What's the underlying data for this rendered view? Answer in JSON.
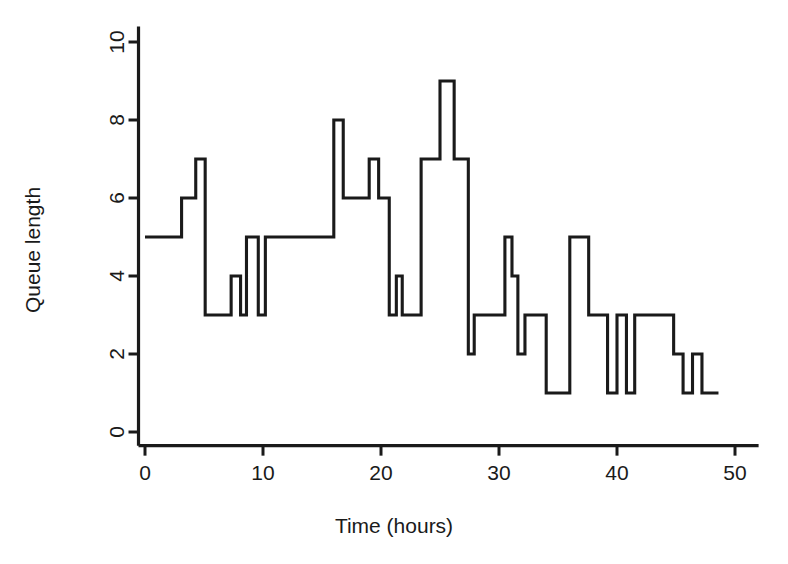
{
  "figure": {
    "background": "#ffffff",
    "ink_color": "#1a1a1a",
    "width": 788,
    "height": 564
  },
  "chart_data": {
    "type": "line",
    "line_style": "step-post",
    "title": "",
    "subtitle": "",
    "xlabel": "Time (hours)",
    "ylabel": "Queue length",
    "xlim": [
      -1.2,
      52.0
    ],
    "ylim": [
      -0.35,
      10.4
    ],
    "xticks": [
      0,
      10,
      20,
      30,
      40,
      50
    ],
    "xtick_labels": [
      "0",
      "10",
      "20",
      "30",
      "40",
      "50"
    ],
    "yticks": [
      0,
      2,
      4,
      6,
      8,
      10
    ],
    "ytick_labels": [
      "0",
      "2",
      "4",
      "6",
      "8",
      "10"
    ],
    "grid": false,
    "legend": null,
    "series": [
      {
        "name": "Queue length",
        "color": "#1a1a1a",
        "x": [
          0.0,
          3.1,
          4.3,
          5.1,
          6.5,
          7.3,
          8.1,
          8.6,
          9.1,
          9.6,
          10.2,
          16.0,
          16.8,
          18.2,
          19.0,
          19.8,
          20.7,
          21.3,
          21.8,
          22.7,
          23.4,
          24.0,
          25.0,
          26.2,
          27.4,
          27.9,
          28.5,
          30.5,
          31.1,
          31.6,
          32.2,
          33.0,
          34.0,
          35.0,
          36.0,
          37.6,
          38.4,
          39.2,
          40.0,
          40.8,
          41.5,
          42.2,
          44.8,
          45.6,
          46.4,
          47.2,
          48.0,
          48.6
        ],
        "y": [
          5,
          6,
          7,
          3,
          3,
          4,
          3,
          5,
          5,
          3,
          5,
          8,
          6,
          6,
          7,
          6,
          3,
          4,
          3,
          3,
          7,
          7,
          9,
          7,
          2,
          3,
          3,
          5,
          4,
          2,
          3,
          3,
          1,
          1,
          5,
          5,
          3,
          1,
          3,
          1,
          3,
          3,
          2,
          1,
          2,
          1,
          1,
          1
        ],
        "steps": [
          {
            "x0": 0.0,
            "x1": 3.1,
            "y": 5
          },
          {
            "x0": 3.1,
            "x1": 4.3,
            "y": 6
          },
          {
            "x0": 4.3,
            "x1": 5.1,
            "y": 7
          },
          {
            "x0": 5.1,
            "x1": 7.3,
            "y": 3
          },
          {
            "x0": 7.3,
            "x1": 8.1,
            "y": 4
          },
          {
            "x0": 8.1,
            "x1": 8.6,
            "y": 3
          },
          {
            "x0": 8.6,
            "x1": 9.6,
            "y": 5
          },
          {
            "x0": 9.6,
            "x1": 10.2,
            "y": 3
          },
          {
            "x0": 10.2,
            "x1": 16.0,
            "y": 5
          },
          {
            "x0": 16.0,
            "x1": 16.8,
            "y": 8
          },
          {
            "x0": 16.8,
            "x1": 19.0,
            "y": 6
          },
          {
            "x0": 19.0,
            "x1": 19.8,
            "y": 7
          },
          {
            "x0": 19.8,
            "x1": 20.7,
            "y": 6
          },
          {
            "x0": 20.7,
            "x1": 21.3,
            "y": 3
          },
          {
            "x0": 21.3,
            "x1": 21.8,
            "y": 4
          },
          {
            "x0": 21.8,
            "x1": 23.4,
            "y": 3
          },
          {
            "x0": 23.4,
            "x1": 25.0,
            "y": 7
          },
          {
            "x0": 25.0,
            "x1": 26.2,
            "y": 9
          },
          {
            "x0": 26.2,
            "x1": 27.4,
            "y": 7
          },
          {
            "x0": 27.4,
            "x1": 27.9,
            "y": 2
          },
          {
            "x0": 27.9,
            "x1": 30.5,
            "y": 3
          },
          {
            "x0": 30.5,
            "x1": 31.1,
            "y": 5
          },
          {
            "x0": 31.1,
            "x1": 31.6,
            "y": 4
          },
          {
            "x0": 31.6,
            "x1": 32.2,
            "y": 2
          },
          {
            "x0": 32.2,
            "x1": 34.0,
            "y": 3
          },
          {
            "x0": 34.0,
            "x1": 36.0,
            "y": 1
          },
          {
            "x0": 36.0,
            "x1": 37.6,
            "y": 5
          },
          {
            "x0": 37.6,
            "x1": 39.2,
            "y": 3
          },
          {
            "x0": 39.2,
            "x1": 40.0,
            "y": 1
          },
          {
            "x0": 40.0,
            "x1": 40.8,
            "y": 3
          },
          {
            "x0": 40.8,
            "x1": 41.5,
            "y": 1
          },
          {
            "x0": 41.5,
            "x1": 44.8,
            "y": 3
          },
          {
            "x0": 44.8,
            "x1": 45.6,
            "y": 2
          },
          {
            "x0": 45.6,
            "x1": 46.4,
            "y": 1
          },
          {
            "x0": 46.4,
            "x1": 47.2,
            "y": 2
          },
          {
            "x0": 47.2,
            "x1": 48.6,
            "y": 1
          }
        ]
      }
    ]
  }
}
